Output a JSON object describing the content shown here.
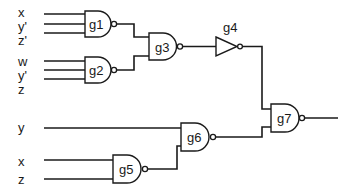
{
  "diagram": {
    "type": "logic-circuit",
    "inputs": {
      "g1": [
        "x",
        "y'",
        "z'"
      ],
      "g2": [
        "w",
        "y'",
        "z"
      ],
      "g6_direct": "y",
      "g5": [
        "x",
        "z"
      ]
    },
    "gates": {
      "g1": {
        "label": "g1",
        "kind": "NAND"
      },
      "g2": {
        "label": "g2",
        "kind": "NAND"
      },
      "g3": {
        "label": "g3",
        "kind": "NAND"
      },
      "g4": {
        "label": "g4",
        "kind": "NOT"
      },
      "g5": {
        "label": "g5",
        "kind": "NAND"
      },
      "g6": {
        "label": "g6",
        "kind": "NAND"
      },
      "g7": {
        "label": "g7",
        "kind": "NAND"
      }
    },
    "connections": [
      "g1 -> g3",
      "g2 -> g3",
      "g3 -> g4",
      "g4 -> g7",
      "y -> g6",
      "g5 -> g6",
      "g6 -> g7"
    ]
  }
}
